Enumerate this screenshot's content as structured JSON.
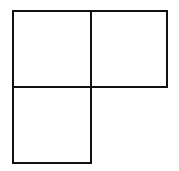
{
  "diagram": {
    "type": "L-tromino",
    "stroke_color": "#111111",
    "fill_color": "#ffffff",
    "cells": [
      {
        "id": "top-left",
        "x": 12,
        "y": 10,
        "w": 80,
        "h": 78
      },
      {
        "id": "top-right",
        "x": 90,
        "y": 10,
        "w": 78,
        "h": 78
      },
      {
        "id": "bottom-left",
        "x": 12,
        "y": 86,
        "w": 80,
        "h": 78
      }
    ]
  }
}
